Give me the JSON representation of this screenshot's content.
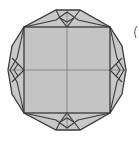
{
  "diagram": {
    "type": "geometric-figure",
    "colors": {
      "fill": "#c8c8c8",
      "stroke": "#3a3a3a",
      "inner_line": "#7a7a7a",
      "background": "#ffffff"
    },
    "outer_polygon": [
      [
        56,
        10
      ],
      [
        80,
        10
      ],
      [
        110,
        27
      ],
      [
        122,
        46
      ],
      [
        126,
        70
      ],
      [
        122,
        94
      ],
      [
        110,
        113
      ],
      [
        80,
        130
      ],
      [
        56,
        130
      ],
      [
        24,
        113
      ],
      [
        12,
        94
      ],
      [
        8,
        70
      ],
      [
        12,
        46
      ],
      [
        24,
        27
      ]
    ],
    "square": {
      "x": 24,
      "y": 27,
      "w": 86,
      "h": 86
    },
    "center": [
      67,
      70
    ],
    "partial_arc_mark": "("
  }
}
